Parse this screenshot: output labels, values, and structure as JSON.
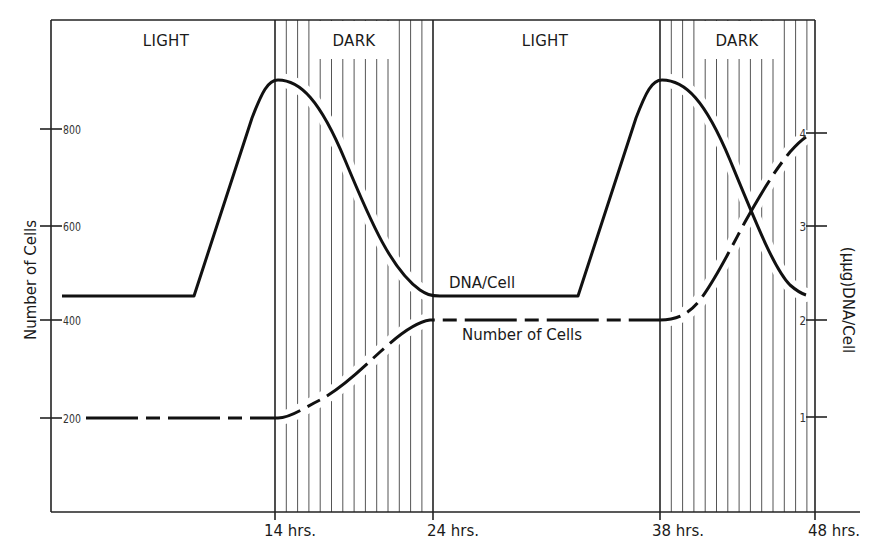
{
  "chart_data": {
    "type": "line",
    "title": "",
    "xlabel": "",
    "x_ticks": [
      "14 hrs.",
      "24 hrs.",
      "38 hrs.",
      "48 hrs."
    ],
    "x_tick_values": [
      14,
      24,
      38,
      48
    ],
    "xlim": [
      0,
      48
    ],
    "phases": [
      {
        "label": "LIGHT",
        "start": 0,
        "end": 14
      },
      {
        "label": "DARK",
        "start": 14,
        "end": 24
      },
      {
        "label": "LIGHT",
        "start": 24,
        "end": 38
      },
      {
        "label": "DARK",
        "start": 38,
        "end": 48
      }
    ],
    "y_left": {
      "label": "Number of Cells",
      "ticks": [
        "200",
        "400",
        "600",
        "800"
      ],
      "tick_values": [
        200,
        400,
        600,
        800
      ],
      "range": [
        0,
        950
      ]
    },
    "y_right": {
      "label": "(µµg)DNA/Cell",
      "ticks": [
        "1",
        "2",
        "3",
        "4"
      ],
      "tick_values": [
        1,
        2,
        3,
        4
      ],
      "range": [
        0,
        4.75
      ]
    },
    "series": [
      {
        "name": "DNA/Cell",
        "axis": "right",
        "style": "solid",
        "x": [
          0.7,
          9,
          12,
          13,
          14,
          16,
          18,
          20,
          22,
          24,
          33,
          36,
          37,
          38,
          40,
          42,
          44,
          46,
          47.6
        ],
        "values": [
          2.25,
          2.25,
          3.9,
          4.4,
          4.52,
          4.35,
          3.8,
          3.0,
          2.4,
          2.25,
          2.25,
          3.9,
          4.4,
          4.52,
          4.3,
          3.6,
          3.0,
          2.5,
          2.35
        ]
      },
      {
        "name": "Number of Cells",
        "axis": "left",
        "style": "dashed",
        "x": [
          2.2,
          14,
          16,
          18,
          20,
          22,
          24,
          38,
          40,
          42,
          44,
          46,
          47.6
        ],
        "values": [
          200,
          200,
          230,
          280,
          340,
          385,
          400,
          400,
          430,
          530,
          650,
          750,
          790
        ]
      }
    ],
    "annotations": [
      {
        "text": "DNA/Cell",
        "x": 26,
        "series": "DNA/Cell"
      },
      {
        "text": "Number of Cells",
        "x": 26,
        "series": "Number of Cells"
      }
    ],
    "grid": false,
    "legend": "inline labels"
  },
  "labels": {
    "phase1": "LIGHT",
    "phase2": "DARK",
    "phase3": "LIGHT",
    "phase4": "DARK",
    "y_left_title": "Number of Cells",
    "y_right_title": "(µµg)DNA/Cell",
    "y_left_ticks": [
      "800",
      "600",
      "400",
      "200"
    ],
    "y_right_ticks": [
      "4",
      "3",
      "2",
      "1"
    ],
    "x_ticks": [
      "14 hrs.",
      "24 hrs.",
      "38 hrs.",
      "48 hrs."
    ],
    "dna_label": "DNA/Cell",
    "cells_label": "Number of Cells"
  }
}
